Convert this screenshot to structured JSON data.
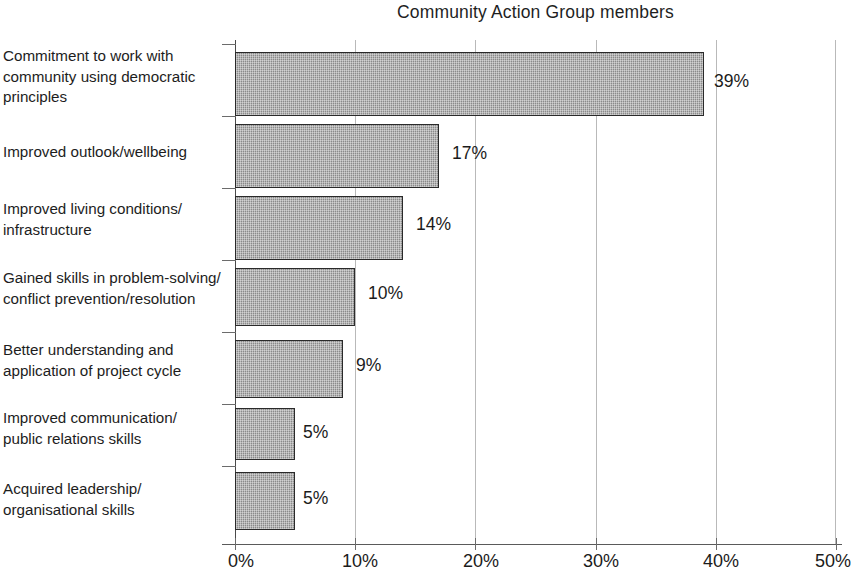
{
  "chart_data": {
    "type": "bar",
    "orientation": "horizontal",
    "title": "Community Action Group members",
    "xlabel": "",
    "ylabel": "",
    "xlim": [
      0,
      50
    ],
    "xtick_labels": [
      "0%",
      "10%",
      "20%",
      "30%",
      "40%",
      "50%"
    ],
    "xticks": [
      0,
      10,
      20,
      30,
      40,
      50
    ],
    "grid": true,
    "grid_axis": "x",
    "legend": false,
    "bar_color": "#9a9a9a",
    "bar_edge_color": "#2a2a2a",
    "categories": [
      "Commitment to work with community using democratic principles",
      "Improved outlook/wellbeing",
      "Improved living conditions/ infrastructure",
      "Gained skills in problem-solving/ conflict prevention/resolution",
      "Better understanding and application of project cycle",
      "Improved communication/ public relations skills",
      "Acquired leadership/ organisational skills"
    ],
    "values": [
      39,
      17,
      14,
      10,
      9,
      5,
      5
    ],
    "value_labels": [
      "39%",
      "17%",
      "14%",
      "10%",
      "9%",
      "5%",
      "5%"
    ],
    "bars": [
      {
        "value": 39,
        "label": "39%",
        "lines": [
          "Commitment to work with",
          "community using democratic",
          "principles"
        ]
      },
      {
        "value": 17,
        "label": "17%",
        "lines": [
          "Improved outlook/wellbeing"
        ]
      },
      {
        "value": 14,
        "label": "14%",
        "lines": [
          "Improved living conditions/",
          "infrastructure"
        ]
      },
      {
        "value": 10,
        "label": "10%",
        "lines": [
          "Gained skills in problem-solving/",
          "conflict prevention/resolution"
        ]
      },
      {
        "value": 9,
        "label": "9%",
        "lines": [
          "Better understanding and",
          "application of project cycle"
        ]
      },
      {
        "value": 5,
        "label": "5%",
        "lines": [
          "Improved communication/",
          "public relations skills"
        ]
      },
      {
        "value": 5,
        "label": "5%",
        "lines": [
          "Acquired leadership/",
          "organisational skills"
        ]
      }
    ]
  }
}
